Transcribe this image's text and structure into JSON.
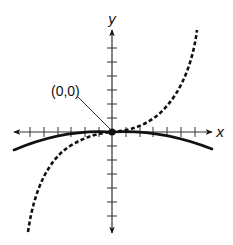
{
  "diagram": {
    "type": "function-graph",
    "axes": {
      "x_label": "x",
      "y_label": "y",
      "origin_px": [
        112,
        132
      ],
      "tick_spacing_px": 13.7,
      "x_ticks_each_side": 6,
      "y_ticks_each_side": 6,
      "arrows": "both-ends"
    },
    "annotation": {
      "label": "(0,0)",
      "points_to": "origin"
    },
    "curves": [
      {
        "name": "solid-curve",
        "style": "solid",
        "shape": "downward-opening parabola, flat at origin",
        "passes_through": "(0,0)"
      },
      {
        "name": "dashed-curve",
        "style": "dashed",
        "shape": "cubic-like, increasing, inflection at origin",
        "passes_through": "(0,0)"
      }
    ],
    "colors": {
      "ink": "#111111",
      "background": "#ffffff"
    }
  }
}
